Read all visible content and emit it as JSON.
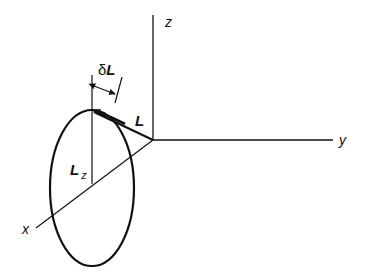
{
  "diagram": {
    "type": "angular-momentum-precession",
    "axes": {
      "z": {
        "label": "z"
      },
      "y": {
        "label": "y"
      },
      "x": {
        "label": "x"
      }
    },
    "vectors": {
      "L": {
        "label": "L"
      },
      "Lz": {
        "label_main": "L",
        "label_sub": "z"
      },
      "dL": {
        "label_prefix": "δ",
        "label_main": "L"
      }
    },
    "colors": {
      "stroke": "#111111",
      "background": "#ffffff"
    }
  }
}
